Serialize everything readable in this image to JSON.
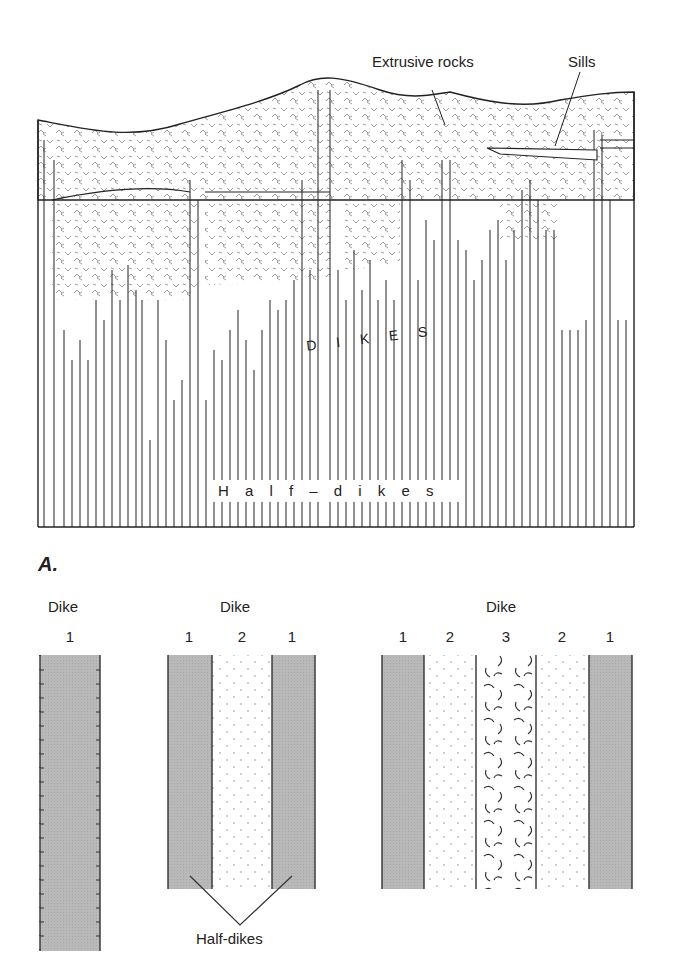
{
  "figure": {
    "panel_label": "A.",
    "top_diagram": {
      "callouts": {
        "extrusive": "Extrusive rocks",
        "sills": "Sills"
      },
      "dikes_label": "D I K E S",
      "half_dikes_label": "H a l f – d i k e s"
    },
    "bottom_diagram": {
      "groups": [
        {
          "title": "Dike",
          "numbers": [
            "1"
          ]
        },
        {
          "title": "Dike",
          "numbers": [
            "1",
            "2",
            "1"
          ]
        },
        {
          "title": "Dike",
          "numbers": [
            "1",
            "2",
            "3",
            "2",
            "1"
          ]
        }
      ],
      "half_dikes_callout": "Half-dikes"
    },
    "colors": {
      "line": "#222222",
      "dike_fill": "#b8b8b8",
      "background": "#ffffff"
    }
  }
}
